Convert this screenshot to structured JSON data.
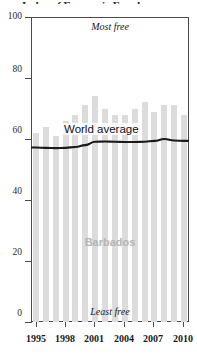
{
  "title_partial": "Index of Economic Freedom",
  "annotations": {
    "most_free": "Most free",
    "least_free": "Least free",
    "country": "Barbados",
    "world_average": "World average"
  },
  "axes": {
    "y_ticks": [
      "0",
      "20",
      "40",
      "60",
      "80",
      "100"
    ],
    "x_ticks": [
      "1995",
      "1998",
      "2001",
      "2004",
      "2007",
      "2010"
    ]
  },
  "colors": {
    "bar": "#dcdcdc",
    "line": "#1a1a1a",
    "axis": "#4a4a4a",
    "country_label": "#b4b4b4",
    "background": "#ffffff"
  },
  "chart_data": {
    "type": "bar",
    "title": "Index of Economic Freedom",
    "xlabel": "",
    "ylabel": "",
    "ylim": [
      0,
      100
    ],
    "xlim": [
      1995,
      2010
    ],
    "grid": false,
    "legend": "inline-annotations",
    "categories": [
      "1995",
      "1996",
      "1997",
      "1998",
      "1999",
      "2000",
      "2001",
      "2002",
      "2003",
      "2004",
      "2005",
      "2006",
      "2007",
      "2008",
      "2009",
      "2010"
    ],
    "series": [
      {
        "name": "Barbados",
        "type": "bar",
        "color": "#dcdcdc",
        "values": [
          62,
          64,
          61,
          66,
          68,
          71,
          74,
          70,
          68,
          68,
          70,
          72,
          69,
          71,
          71,
          68
        ]
      },
      {
        "name": "World average",
        "type": "line",
        "color": "#1a1a1a",
        "values": [
          57.2,
          57.1,
          57.0,
          57.1,
          57.4,
          58.0,
          59.1,
          59.2,
          59.1,
          59.0,
          59.0,
          59.1,
          59.4,
          60.0,
          59.5,
          59.4
        ]
      }
    ],
    "scale_note": {
      "top": "Most free",
      "bottom": "Least free"
    }
  }
}
